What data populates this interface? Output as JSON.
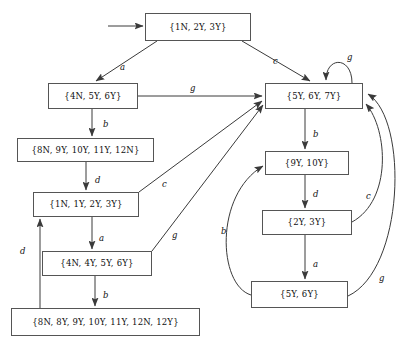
{
  "diagram": {
    "type": "finite-state-automaton",
    "stroke_color": "#3a3a3a",
    "box_border_color": "#555555",
    "text_color": "#111111",
    "background": "#ffffff"
  },
  "nodes": [
    {
      "id": "n0",
      "label": "{1N, 2Y, 3Y}",
      "x": 145,
      "y": 13,
      "w": 106,
      "h": 28,
      "initial": true
    },
    {
      "id": "n1",
      "label": "{4N, 5Y, 6Y}",
      "x": 48,
      "y": 83,
      "w": 90,
      "h": 26,
      "initial": false
    },
    {
      "id": "n2",
      "label": "{8N, 9Y, 10Y, 11Y, 12N}",
      "x": 17,
      "y": 138,
      "w": 137,
      "h": 24,
      "initial": false
    },
    {
      "id": "n3",
      "label": "{1N, 1Y, 2Y, 3Y}",
      "x": 33,
      "y": 192,
      "w": 106,
      "h": 25,
      "initial": false
    },
    {
      "id": "n4",
      "label": "{4N, 4Y, 5Y, 6Y}",
      "x": 42,
      "y": 251,
      "w": 110,
      "h": 25,
      "initial": false
    },
    {
      "id": "n5",
      "label": "{8N, 8Y, 9Y, 10Y, 11Y, 12N, 12Y}",
      "x": 11,
      "y": 308,
      "w": 189,
      "h": 28,
      "initial": false
    },
    {
      "id": "n6",
      "label": "{5Y, 6Y, 7Y}",
      "x": 265,
      "y": 83,
      "w": 98,
      "h": 26,
      "initial": false
    },
    {
      "id": "n7",
      "label": "{9Y, 10Y}",
      "x": 265,
      "y": 151,
      "w": 84,
      "h": 24,
      "initial": false
    },
    {
      "id": "n8",
      "label": "{2Y, 3Y}",
      "x": 262,
      "y": 210,
      "w": 90,
      "h": 25,
      "initial": false
    },
    {
      "id": "n9",
      "label": "{5Y, 6Y}",
      "x": 251,
      "y": 281,
      "w": 97,
      "h": 27,
      "initial": false
    }
  ],
  "edges": [
    {
      "id": "e-start",
      "from": "start",
      "to": "n0",
      "label": "",
      "label_x": 0,
      "label_y": 0
    },
    {
      "id": "e0-n1",
      "from": "n0",
      "to": "n1",
      "label": "a",
      "label_x": 120,
      "label_y": 63
    },
    {
      "id": "e0-n6",
      "from": "n0",
      "to": "n6",
      "label": "c",
      "label_x": 273,
      "label_y": 57
    },
    {
      "id": "e1-n2",
      "from": "n1",
      "to": "n2",
      "label": "b",
      "label_x": 103,
      "label_y": 120
    },
    {
      "id": "e1-n6",
      "from": "n1",
      "to": "n6",
      "label": "g",
      "label_x": 190,
      "label_y": 84
    },
    {
      "id": "e2-n3",
      "from": "n2",
      "to": "n3",
      "label": "d",
      "label_x": 95,
      "label_y": 176
    },
    {
      "id": "e3-n4",
      "from": "n3",
      "to": "n4",
      "label": "a",
      "label_x": 99,
      "label_y": 234
    },
    {
      "id": "e3-n6",
      "from": "n3",
      "to": "n6",
      "label": "c",
      "label_x": 162,
      "label_y": 180
    },
    {
      "id": "e4-n5",
      "from": "n4",
      "to": "n5",
      "label": "b",
      "label_x": 103,
      "label_y": 291
    },
    {
      "id": "e4-n6",
      "from": "n4",
      "to": "n6",
      "label": "g",
      "label_x": 172,
      "label_y": 231
    },
    {
      "id": "e5-n3",
      "from": "n5",
      "to": "n3",
      "label": "d",
      "label_x": 20,
      "label_y": 247
    },
    {
      "id": "e6-self",
      "from": "n6",
      "to": "n6",
      "label": "g",
      "label_x": 347,
      "label_y": 53
    },
    {
      "id": "e6-n7",
      "from": "n6",
      "to": "n7",
      "label": "b",
      "label_x": 313,
      "label_y": 130
    },
    {
      "id": "e7-n8",
      "from": "n7",
      "to": "n8",
      "label": "d",
      "label_x": 313,
      "label_y": 190
    },
    {
      "id": "e8-n9",
      "from": "n8",
      "to": "n9",
      "label": "a",
      "label_x": 313,
      "label_y": 260
    },
    {
      "id": "e9-n7",
      "from": "n9",
      "to": "n7",
      "label": "b",
      "label_x": 221,
      "label_y": 227
    },
    {
      "id": "e8-n6",
      "from": "n8",
      "to": "n6",
      "label": "c",
      "label_x": 366,
      "label_y": 192
    },
    {
      "id": "e9-n6",
      "from": "n9",
      "to": "n6",
      "label": "g",
      "label_x": 379,
      "label_y": 274
    }
  ]
}
